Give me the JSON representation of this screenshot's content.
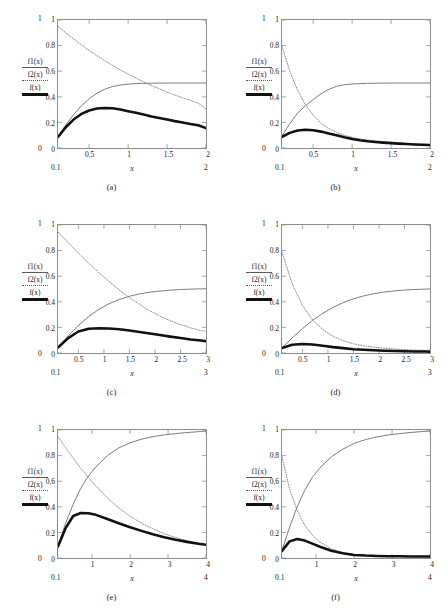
{
  "figure": {
    "layout": "2 columns x 3 rows",
    "panel_count": 6
  },
  "legend": {
    "f1_label": "f1(x)",
    "f2_label": "f2(x)",
    "f_label": "f(x)",
    "f1_style": "thin-solid-line",
    "f2_style": "dotted-line",
    "f_style": "thick-solid-line"
  },
  "colors": {
    "f1": "#6b6b6b",
    "f2": "#7a7a7a",
    "f": "#111111",
    "frame": "#8c8c8c",
    "text": "#1a1a1a",
    "background": "#ffffff"
  },
  "chart_data": [
    {
      "type": "line",
      "panel": "(a)",
      "title": "",
      "xlabel": "x",
      "ylabel": "",
      "xlim": [
        0.1,
        2
      ],
      "ylim": [
        0,
        1
      ],
      "xticks": [
        "0.5",
        "1",
        "1.5",
        "2"
      ],
      "xtick_values": [
        0.5,
        1,
        1.5,
        2
      ],
      "yticks": [
        "0",
        "0.2",
        "0.4",
        "0.6",
        "0.8",
        "1"
      ],
      "ytick_values": [
        0,
        0.2,
        0.4,
        0.6,
        0.8,
        1
      ],
      "outer_x_left": "0.1",
      "outer_x_right": "2",
      "outer_y_top": "1",
      "outer_y_bottom": "0",
      "grid": false,
      "legend_position": "left-outside",
      "x": [
        0.1,
        0.2,
        0.3,
        0.4,
        0.5,
        0.6,
        0.7,
        0.8,
        0.9,
        1.0,
        1.1,
        1.2,
        1.3,
        1.4,
        1.5,
        1.6,
        1.7,
        1.8,
        1.9,
        2.0
      ],
      "series": [
        {
          "name": "f1(x)",
          "style": "solid",
          "values": [
            0.09,
            0.18,
            0.26,
            0.33,
            0.385,
            0.428,
            0.459,
            0.48,
            0.492,
            0.499,
            0.503,
            0.505,
            0.506,
            0.507,
            0.507,
            0.508,
            0.508,
            0.508,
            0.508,
            0.508
          ]
        },
        {
          "name": "f2(x)",
          "style": "dotted",
          "values": [
            0.95,
            0.9,
            0.852,
            0.806,
            0.762,
            0.721,
            0.682,
            0.645,
            0.61,
            0.577,
            0.546,
            0.517,
            0.489,
            0.463,
            0.438,
            0.414,
            0.392,
            0.371,
            0.351,
            0.305
          ]
        },
        {
          "name": "f(x)",
          "style": "thick",
          "values": [
            0.086,
            0.162,
            0.222,
            0.266,
            0.293,
            0.309,
            0.313,
            0.31,
            0.3,
            0.288,
            0.275,
            0.261,
            0.247,
            0.235,
            0.222,
            0.21,
            0.2,
            0.188,
            0.178,
            0.155
          ]
        }
      ]
    },
    {
      "type": "line",
      "panel": "(b)",
      "title": "",
      "xlabel": "x",
      "ylabel": "",
      "xlim": [
        0.1,
        2
      ],
      "ylim": [
        0,
        1
      ],
      "xticks": [
        "0.5",
        "1",
        "1.5",
        "2"
      ],
      "xtick_values": [
        0.5,
        1,
        1.5,
        2
      ],
      "yticks": [
        "0",
        "0.2",
        "0.4",
        "0.6",
        "0.8",
        "1"
      ],
      "ytick_values": [
        0,
        0.2,
        0.4,
        0.6,
        0.8,
        1
      ],
      "outer_x_left": "0.1",
      "outer_x_right": "2",
      "outer_y_top": "1",
      "outer_y_bottom": "0",
      "grid": false,
      "legend_position": "left-outside",
      "x": [
        0.1,
        0.2,
        0.3,
        0.4,
        0.5,
        0.6,
        0.7,
        0.8,
        0.9,
        1.0,
        1.1,
        1.2,
        1.3,
        1.4,
        1.5,
        1.6,
        1.7,
        1.8,
        1.9,
        2.0
      ],
      "series": [
        {
          "name": "f1(x)",
          "style": "solid",
          "values": [
            0.095,
            0.19,
            0.272,
            0.33,
            0.378,
            0.423,
            0.458,
            0.482,
            0.494,
            0.5,
            0.503,
            0.505,
            0.506,
            0.507,
            0.507,
            0.508,
            0.508,
            0.508,
            0.508,
            0.508
          ]
        },
        {
          "name": "f2(x)",
          "style": "dotted",
          "values": [
            0.795,
            0.6,
            0.452,
            0.34,
            0.256,
            0.193,
            0.152,
            0.122,
            0.1,
            0.083,
            0.071,
            0.062,
            0.055,
            0.049,
            0.045,
            0.04,
            0.036,
            0.032,
            0.029,
            0.026
          ]
        },
        {
          "name": "f(x)",
          "style": "thick",
          "values": [
            0.088,
            0.118,
            0.136,
            0.143,
            0.139,
            0.128,
            0.114,
            0.099,
            0.084,
            0.071,
            0.061,
            0.053,
            0.047,
            0.042,
            0.038,
            0.034,
            0.031,
            0.028,
            0.026,
            0.024
          ]
        }
      ]
    },
    {
      "type": "line",
      "panel": "(c)",
      "title": "",
      "xlabel": "x",
      "ylabel": "",
      "xlim": [
        0.1,
        3
      ],
      "ylim": [
        0,
        1
      ],
      "xticks": [
        "0.5",
        "1",
        "1.5",
        "2",
        "2.5",
        "3"
      ],
      "xtick_values": [
        0.5,
        1,
        1.5,
        2,
        2.5,
        3
      ],
      "yticks": [
        "0",
        "0.2",
        "0.4",
        "0.6",
        "0.8",
        "1"
      ],
      "ytick_values": [
        0,
        0.2,
        0.4,
        0.6,
        0.8,
        1
      ],
      "outer_x_left": "0.1",
      "outer_x_right": "3",
      "outer_y_top": "1",
      "outer_y_bottom": "0",
      "grid": false,
      "legend_position": "left-outside",
      "x": [
        0.1,
        0.3,
        0.5,
        0.7,
        0.9,
        1.1,
        1.3,
        1.5,
        1.7,
        1.9,
        2.1,
        2.3,
        2.5,
        2.7,
        2.9,
        3.0
      ],
      "series": [
        {
          "name": "f1(x)",
          "style": "solid",
          "values": [
            0.045,
            0.135,
            0.215,
            0.285,
            0.34,
            0.385,
            0.418,
            0.443,
            0.462,
            0.475,
            0.484,
            0.491,
            0.496,
            0.499,
            0.501,
            0.502
          ]
        },
        {
          "name": "f2(x)",
          "style": "dotted",
          "values": [
            0.945,
            0.862,
            0.78,
            0.702,
            0.628,
            0.558,
            0.492,
            0.432,
            0.378,
            0.33,
            0.288,
            0.252,
            0.222,
            0.196,
            0.176,
            0.168
          ]
        },
        {
          "name": "f(x)",
          "style": "thick",
          "values": [
            0.043,
            0.116,
            0.168,
            0.19,
            0.194,
            0.192,
            0.186,
            0.176,
            0.164,
            0.152,
            0.14,
            0.128,
            0.117,
            0.106,
            0.097,
            0.092
          ]
        }
      ]
    },
    {
      "type": "line",
      "panel": "(d)",
      "title": "",
      "xlabel": "x",
      "ylabel": "",
      "xlim": [
        0.1,
        3
      ],
      "ylim": [
        0,
        1
      ],
      "xticks": [
        "0.5",
        "1",
        "1.5",
        "2",
        "2.5",
        "3"
      ],
      "xtick_values": [
        0.5,
        1,
        1.5,
        2,
        2.5,
        3
      ],
      "yticks": [
        "0",
        "0.2",
        "0.4",
        "0.6",
        "0.8",
        "1"
      ],
      "ytick_values": [
        0,
        0.2,
        0.4,
        0.6,
        0.8,
        1
      ],
      "outer_x_left": "0.1",
      "outer_x_right": "3",
      "outer_y_top": "1",
      "outer_y_bottom": "0",
      "grid": false,
      "legend_position": "left-outside",
      "x": [
        0.1,
        0.3,
        0.5,
        0.7,
        0.9,
        1.1,
        1.3,
        1.5,
        1.7,
        1.9,
        2.1,
        2.3,
        2.5,
        2.7,
        2.9,
        3.0
      ],
      "series": [
        {
          "name": "f1(x)",
          "style": "solid",
          "values": [
            0.04,
            0.118,
            0.19,
            0.255,
            0.31,
            0.356,
            0.394,
            0.423,
            0.446,
            0.463,
            0.476,
            0.485,
            0.492,
            0.496,
            0.499,
            0.5
          ]
        },
        {
          "name": "f2(x)",
          "style": "dotted",
          "values": [
            0.79,
            0.54,
            0.372,
            0.258,
            0.182,
            0.13,
            0.095,
            0.072,
            0.056,
            0.045,
            0.037,
            0.031,
            0.026,
            0.023,
            0.021,
            0.02
          ]
        },
        {
          "name": "f(x)",
          "style": "thick",
          "values": [
            0.038,
            0.064,
            0.071,
            0.066,
            0.056,
            0.046,
            0.038,
            0.03,
            0.025,
            0.021,
            0.018,
            0.015,
            0.013,
            0.012,
            0.011,
            0.01
          ]
        }
      ]
    },
    {
      "type": "line",
      "panel": "(e)",
      "title": "",
      "xlabel": "x",
      "ylabel": "",
      "xlim": [
        0.1,
        4
      ],
      "ylim": [
        0,
        1
      ],
      "xticks": [
        "1",
        "2",
        "3",
        "4"
      ],
      "xtick_values": [
        1,
        2,
        3,
        4
      ],
      "yticks": [
        "0",
        "0.2",
        "0.4",
        "0.6",
        "0.8",
        "1"
      ],
      "ytick_values": [
        0,
        0.2,
        0.4,
        0.6,
        0.8,
        1
      ],
      "outer_x_left": "0.1",
      "outer_x_right": "4",
      "outer_y_top": "1",
      "outer_y_bottom": "0",
      "grid": false,
      "legend_position": "left-outside",
      "x": [
        0.1,
        0.3,
        0.5,
        0.7,
        0.9,
        1.1,
        1.4,
        1.7,
        2.0,
        2.3,
        2.6,
        2.9,
        3.2,
        3.5,
        3.8,
        4.0
      ],
      "series": [
        {
          "name": "f1(x)",
          "style": "solid",
          "values": [
            0.095,
            0.27,
            0.42,
            0.545,
            0.64,
            0.712,
            0.8,
            0.86,
            0.9,
            0.928,
            0.948,
            0.962,
            0.972,
            0.98,
            0.987,
            0.992
          ]
        },
        {
          "name": "f2(x)",
          "style": "dotted",
          "values": [
            0.948,
            0.862,
            0.78,
            0.7,
            0.63,
            0.562,
            0.47,
            0.392,
            0.326,
            0.272,
            0.228,
            0.19,
            0.16,
            0.135,
            0.115,
            0.104
          ]
        },
        {
          "name": "f(x)",
          "style": "thick",
          "values": [
            0.09,
            0.233,
            0.328,
            0.352,
            0.35,
            0.337,
            0.305,
            0.272,
            0.24,
            0.212,
            0.186,
            0.163,
            0.143,
            0.126,
            0.112,
            0.103
          ]
        }
      ]
    },
    {
      "type": "line",
      "panel": "(f)",
      "title": "",
      "xlabel": "x",
      "ylabel": "",
      "xlim": [
        0.1,
        4
      ],
      "ylim": [
        0,
        1
      ],
      "xticks": [
        "1",
        "2",
        "3",
        "4"
      ],
      "xtick_values": [
        1,
        2,
        3,
        4
      ],
      "yticks": [
        "0",
        "0.2",
        "0.4",
        "0.6",
        "0.8",
        "1"
      ],
      "ytick_values": [
        0,
        0.2,
        0.4,
        0.6,
        0.8,
        1
      ],
      "outer_x_left": "0.1",
      "outer_x_right": "4",
      "outer_y_top": "1",
      "outer_y_bottom": "0",
      "grid": false,
      "legend_position": "left-outside",
      "x": [
        0.1,
        0.3,
        0.5,
        0.7,
        0.9,
        1.1,
        1.4,
        1.7,
        2.0,
        2.3,
        2.6,
        2.9,
        3.2,
        3.5,
        3.8,
        4.0
      ],
      "series": [
        {
          "name": "f1(x)",
          "style": "solid",
          "values": [
            0.06,
            0.24,
            0.4,
            0.53,
            0.63,
            0.705,
            0.79,
            0.85,
            0.895,
            0.925,
            0.946,
            0.961,
            0.972,
            0.981,
            0.988,
            0.992
          ]
        },
        {
          "name": "f2(x)",
          "style": "dotted",
          "values": [
            0.79,
            0.54,
            0.372,
            0.256,
            0.178,
            0.124,
            0.072,
            0.043,
            0.027,
            0.02,
            0.016,
            0.014,
            0.013,
            0.012,
            0.011,
            0.011
          ]
        },
        {
          "name": "f(x)",
          "style": "thick",
          "values": [
            0.056,
            0.13,
            0.148,
            0.136,
            0.112,
            0.088,
            0.057,
            0.037,
            0.024,
            0.019,
            0.016,
            0.014,
            0.013,
            0.012,
            0.011,
            0.011
          ]
        }
      ]
    }
  ]
}
